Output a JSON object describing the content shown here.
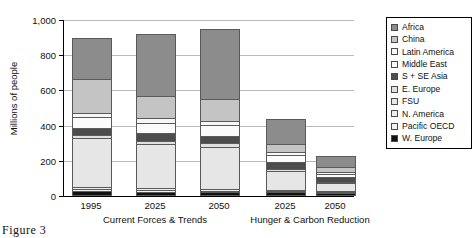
{
  "chart_data": {
    "type": "bar",
    "title": "",
    "xlabel": "",
    "ylabel": "Millions of people",
    "ylim": [
      0,
      1000
    ],
    "yticks": [
      0,
      200,
      400,
      600,
      800,
      1000
    ],
    "ytick_labels": [
      "0",
      "200",
      "400",
      "600",
      "800",
      "1,000"
    ],
    "grid": true,
    "stacked": true,
    "legend_position": "right",
    "groups": [
      {
        "label": "Current Forces & Trends",
        "categories": [
          "1995",
          "2025",
          "2050"
        ]
      },
      {
        "label": "Hunger & Carbon Reduction",
        "categories": [
          "2025",
          "2050"
        ]
      }
    ],
    "categories": [
      "1995",
      "2025",
      "2050",
      "2025",
      "2050"
    ],
    "series": [
      {
        "name": "W. Europe",
        "color": "#111111",
        "values": [
          18,
          14,
          12,
          10,
          8
        ]
      },
      {
        "name": "Pacific OECD",
        "color": "#f2f2f2",
        "values": [
          10,
          8,
          7,
          6,
          5
        ]
      },
      {
        "name": "N. America",
        "color": "#ededed",
        "values": [
          12,
          10,
          9,
          8,
          6
        ]
      },
      {
        "name": "FSU",
        "color": "#e6e6e6",
        "values": [
          280,
          255,
          245,
          110,
          45
        ]
      },
      {
        "name": "E. Europe",
        "color": "#e0e0e0",
        "values": [
          22,
          20,
          18,
          14,
          10
        ]
      },
      {
        "name": "S + SE Asia",
        "color": "#4d4d4d",
        "values": [
          40,
          42,
          45,
          38,
          26
        ]
      },
      {
        "name": "Middle East",
        "color": "#fbfbfb",
        "values": [
          60,
          62,
          62,
          42,
          22
        ]
      },
      {
        "name": "Latin America",
        "color": "#f7f7f7",
        "values": [
          22,
          24,
          24,
          16,
          10
        ]
      },
      {
        "name": "China",
        "color": "#c4c4c4",
        "values": [
          200,
          130,
          122,
          46,
          30
        ]
      },
      {
        "name": "Africa",
        "color": "#8c8c8c",
        "values": [
          236,
          355,
          406,
          150,
          68
        ]
      }
    ],
    "totals": [
      900,
      920,
      950,
      440,
      230
    ]
  },
  "legend": {
    "entries": [
      {
        "label": "Africa"
      },
      {
        "label": "China"
      },
      {
        "label": "Latin America"
      },
      {
        "label": "Middle East"
      },
      {
        "label": "S + SE Asia"
      },
      {
        "label": "E. Europe"
      },
      {
        "label": "FSU"
      },
      {
        "label": "N. America"
      },
      {
        "label": "Pacific OECD"
      },
      {
        "label": "W. Europe"
      }
    ]
  },
  "caption": "Figure 3"
}
